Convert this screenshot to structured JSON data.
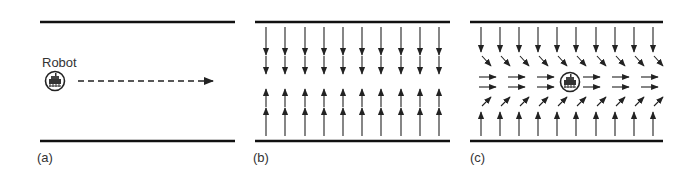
{
  "panels": [
    {
      "id": "a",
      "label": "(a)",
      "robot_label": "Robot",
      "description": "Robot moving along corridor centerline (dashed arrow)"
    },
    {
      "id": "b",
      "label": "(b)",
      "description": "Repulsive field: arrows pointing away from walls toward center"
    },
    {
      "id": "c",
      "label": "(c)",
      "description": "Combined field: arrows converge to centerline and flow forward past robot"
    }
  ],
  "colors": {
    "wall": "#111111",
    "arrow": "#222222",
    "text": "#333333",
    "background": "#ffffff"
  },
  "geometry": {
    "wall_top_y": 22,
    "wall_bottom_y": 141,
    "panel_a": {
      "x1": 40,
      "x2": 235
    },
    "panel_b": {
      "x1": 255,
      "x2": 450
    },
    "panel_c": {
      "x1": 470,
      "x2": 663
    },
    "b_arrow_xs": [
      266,
      285,
      305,
      324,
      343,
      362,
      381,
      401,
      420,
      439
    ],
    "c_arrow_xs": [
      481,
      500,
      519,
      538,
      557,
      576,
      596,
      615,
      634,
      653
    ]
  }
}
